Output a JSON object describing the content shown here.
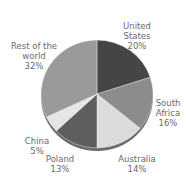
{
  "chart_data": {
    "type": "pie",
    "title": "",
    "style": "3d-tilted",
    "slices": [
      {
        "label": "United States",
        "value": 20,
        "color": "#454545"
      },
      {
        "label": "South Africa",
        "value": 16,
        "color": "#8c8c8c"
      },
      {
        "label": "Australia",
        "value": 14,
        "color": "#dcdcdc"
      },
      {
        "label": "Poland",
        "value": 13,
        "color": "#5e5e5e"
      },
      {
        "label": "China",
        "value": 5,
        "color": "#e6e6e6"
      },
      {
        "label": "Rest of the world",
        "value": 32,
        "color": "#9a9a9a"
      }
    ],
    "start_angle_deg": 0,
    "direction": "clockwise",
    "value_format": "percent",
    "legend": "none (labels placed beside slices)"
  },
  "labels": {
    "us": {
      "line1": "United",
      "line2": "States",
      "pct": "20%"
    },
    "sa": {
      "line1": "South",
      "line2": "Africa",
      "pct": "16%"
    },
    "au": {
      "line1": "Australia",
      "pct": "14%"
    },
    "pl": {
      "line1": "Poland",
      "pct": "13%"
    },
    "cn": {
      "line1": "China",
      "pct": "5%"
    },
    "rw": {
      "line1": "Rest of the",
      "line2": "world",
      "pct": "32%"
    }
  }
}
